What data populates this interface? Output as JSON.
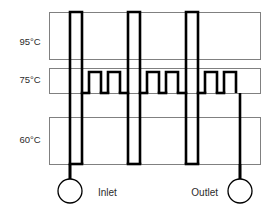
{
  "diagram": {
    "type": "schematic",
    "canvas": {
      "width": 272,
      "height": 213
    },
    "colors": {
      "background": "#ffffff",
      "zone_border": "#808080",
      "channel": "#000000",
      "text": "#2b2b2b"
    },
    "zones": [
      {
        "id": "denaturation",
        "label": "95°C",
        "label_x": 30,
        "label_y": 42,
        "rect": {
          "x": 49,
          "y": 12,
          "width": 211,
          "height": 47
        }
      },
      {
        "id": "extension",
        "label": "75°C",
        "label_x": 30,
        "label_y": 80,
        "rect": {
          "x": 49,
          "y": 68,
          "width": 211,
          "height": 25
        }
      },
      {
        "id": "annealing",
        "label": "60°C",
        "label_x": 30,
        "label_y": 140,
        "rect": {
          "x": 49,
          "y": 117,
          "width": 211,
          "height": 47
        }
      }
    ],
    "ports": [
      {
        "id": "inlet",
        "label": "Inlet",
        "label_x": 98,
        "label_y": 193,
        "circle": {
          "cx": 70,
          "cy": 191,
          "r": 12
        },
        "stem": {
          "x": 70,
          "y1": 164,
          "y2": 179
        }
      },
      {
        "id": "outlet",
        "label": "Outlet",
        "label_x": 218,
        "label_y": 193,
        "circle": {
          "cx": 240,
          "cy": 191,
          "r": 12
        },
        "stem": {
          "x": 240,
          "y1": 164,
          "y2": 179
        }
      }
    ],
    "channel": {
      "stroke_width": 2.6,
      "top_y": 12,
      "mid_top_y": 72,
      "mid_bottom_y": 93,
      "bottom_y": 164,
      "tall_loops": [
        {
          "id": "tall-loop-1",
          "x_left": 70,
          "x_right": 82
        },
        {
          "id": "tall-loop-2",
          "x_left": 128,
          "x_right": 140
        },
        {
          "id": "tall-loop-3",
          "x_left": 186,
          "x_right": 198
        }
      ],
      "short_loops": [
        {
          "id": "short-loop-1",
          "x_left": 89,
          "x_right": 101
        },
        {
          "id": "short-loop-2",
          "x_left": 108,
          "x_right": 120
        },
        {
          "id": "short-loop-3",
          "x_left": 147,
          "x_right": 159
        },
        {
          "id": "short-loop-4",
          "x_left": 166,
          "x_right": 178
        },
        {
          "id": "short-loop-5",
          "x_left": 205,
          "x_right": 217
        },
        {
          "id": "short-loop-6",
          "x_left": 224,
          "x_right": 236
        }
      ],
      "descenders": [
        {
          "id": "descender-inlet",
          "x": 70,
          "y1": 93,
          "y2": 179
        },
        {
          "id": "descender-1",
          "x": 82,
          "y1": 93,
          "y2": 164
        },
        {
          "id": "descender-2",
          "x": 128,
          "y1": 93,
          "y2": 164
        },
        {
          "id": "descender-3",
          "x": 140,
          "y1": 93,
          "y2": 164
        },
        {
          "id": "descender-4",
          "x": 186,
          "y1": 93,
          "y2": 164
        },
        {
          "id": "descender-5",
          "x": 198,
          "y1": 93,
          "y2": 164
        },
        {
          "id": "descender-outlet",
          "x": 240,
          "y1": 93,
          "y2": 179
        }
      ]
    }
  }
}
